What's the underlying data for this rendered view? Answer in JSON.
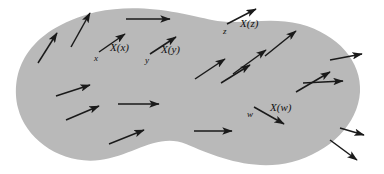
{
  "figure": {
    "caption": "",
    "colors": {
      "manifold_fill": "#b9b9b9",
      "vector_stroke": "#1a1a1a",
      "background": "#ffffff",
      "label_color": "#111111"
    },
    "manifold": {
      "name": "manifold-region",
      "shape": "blob",
      "path": "M 96 12 C 140 2 186 14 212 20 C 240 26 268 16 300 24 C 338 34 362 62 360 92 C 358 124 330 152 292 162 C 252 172 214 156 186 144 C 158 132 132 156 100 160 C 62 165 26 140 18 108 C 10 74 24 30 96 12 Z"
    },
    "labeled_points": [
      {
        "id": "x",
        "point_label": "x",
        "vector_label": "X(x)",
        "point_label_pos": {
          "x": 94,
          "y": 54
        },
        "vector_label_pos": {
          "x": 110,
          "y": 42
        },
        "arrow": {
          "x1": 99,
          "y1": 52,
          "x2": 125,
          "y2": 34
        }
      },
      {
        "id": "y",
        "point_label": "y",
        "vector_label": "X(y)",
        "point_label_pos": {
          "x": 145,
          "y": 56
        },
        "vector_label_pos": {
          "x": 161,
          "y": 44
        },
        "arrow": {
          "x1": 150,
          "y1": 54,
          "x2": 176,
          "y2": 37
        }
      },
      {
        "id": "z",
        "point_label": "z",
        "vector_label": "X(z)",
        "point_label_pos": {
          "x": 223,
          "y": 27
        },
        "vector_label_pos": {
          "x": 240,
          "y": 18
        },
        "arrow": {
          "x1": 227,
          "y1": 24,
          "x2": 256,
          "y2": 9
        }
      },
      {
        "id": "w",
        "point_label": "w",
        "vector_label": "X(w)",
        "point_label_pos": {
          "x": 247,
          "y": 110
        },
        "vector_label_pos": {
          "x": 270,
          "y": 102
        },
        "arrow": {
          "x1": 254,
          "y1": 107,
          "x2": 284,
          "y2": 124
        }
      }
    ],
    "vectors": [
      {
        "id": "v-upper-left-1",
        "x1": 38,
        "y1": 63,
        "x2": 57,
        "y2": 33
      },
      {
        "id": "v-upper-left-2",
        "x1": 71,
        "y1": 47,
        "x2": 90,
        "y2": 13
      },
      {
        "id": "v-top-horizontal",
        "x1": 126,
        "y1": 19,
        "x2": 170,
        "y2": 19
      },
      {
        "id": "v-left-mid-1",
        "x1": 56,
        "y1": 96,
        "x2": 90,
        "y2": 85
      },
      {
        "id": "v-left-mid-2",
        "x1": 66,
        "y1": 120,
        "x2": 99,
        "y2": 106
      },
      {
        "id": "v-left-horizontal",
        "x1": 118,
        "y1": 104,
        "x2": 159,
        "y2": 104
      },
      {
        "id": "v-lower-left",
        "x1": 109,
        "y1": 144,
        "x2": 144,
        "y2": 130
      },
      {
        "id": "v-center-diag-1",
        "x1": 195,
        "y1": 79,
        "x2": 225,
        "y2": 59
      },
      {
        "id": "v-center-diag-2",
        "x1": 221,
        "y1": 83,
        "x2": 250,
        "y2": 65
      },
      {
        "id": "v-center-diag-3",
        "x1": 233,
        "y1": 74,
        "x2": 266,
        "y2": 50
      },
      {
        "id": "v-upper-right-diag",
        "x1": 265,
        "y1": 56,
        "x2": 296,
        "y2": 31
      },
      {
        "id": "v-bottom-horizontal",
        "x1": 194,
        "y1": 131,
        "x2": 232,
        "y2": 131
      },
      {
        "id": "v-right-diag-1",
        "x1": 296,
        "y1": 92,
        "x2": 330,
        "y2": 72
      },
      {
        "id": "v-right-horizontal-1",
        "x1": 330,
        "y1": 60,
        "x2": 362,
        "y2": 54
      },
      {
        "id": "v-right-horizontal-2",
        "x1": 303,
        "y1": 83,
        "x2": 343,
        "y2": 81
      },
      {
        "id": "v-right-edge-out",
        "x1": 340,
        "y1": 128,
        "x2": 364,
        "y2": 135
      },
      {
        "id": "v-bottom-right-out",
        "x1": 330,
        "y1": 140,
        "x2": 357,
        "y2": 160
      }
    ]
  }
}
